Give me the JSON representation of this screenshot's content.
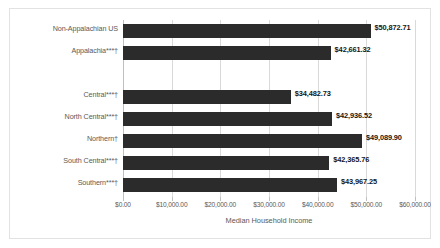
{
  "chart_data": {
    "type": "bar",
    "orientation": "horizontal",
    "title": "",
    "xlabel": "Median Household Income",
    "ylabel": "",
    "xlim": [
      0,
      60000
    ],
    "grid": true,
    "legend": "none",
    "xticks": [
      "$0.00",
      "$10,000.00",
      "$20,000.00",
      "$30,000.00",
      "$40,000.00",
      "$50,000.00",
      "$60,000.00"
    ],
    "xtick_values": [
      0,
      10000,
      20000,
      30000,
      40000,
      50000,
      60000
    ],
    "categories": [
      "Non-Appalachian US",
      "Appalachia***†",
      "",
      "Central***†",
      "North Central***†",
      "Northern†",
      "South Central***†",
      "Southern***†"
    ],
    "values": [
      50872.71,
      42661.32,
      null,
      34482.73,
      42936.52,
      49089.9,
      42365.76,
      43967.25
    ],
    "data_labels": [
      "$50,872.71",
      "$42,661.32",
      "",
      "$34,482.73",
      "$42,936.52",
      "$49,089.90",
      "$42,365.76",
      "$43,967.25"
    ],
    "bar_color": "#2b2b2b"
  },
  "rows": [
    {
      "label": "Non-Appalachian US",
      "value_label": "$50,872.71",
      "value": 50872.71
    },
    {
      "label": "Appalachia***†",
      "value_label": "$42,661.32",
      "value": 42661.32
    },
    {
      "label": "Central***†",
      "value_label": "$34,482.73",
      "value": 34482.73
    },
    {
      "label": "North Central***†",
      "value_label": "$42,936.52",
      "value": 42936.52
    },
    {
      "label": "Northern†",
      "value_label": "$49,089.90",
      "value": 49089.9
    },
    {
      "label": "South Central***†",
      "value_label": "$42,365.76",
      "value": 42365.76
    },
    {
      "label": "Southern***†",
      "value_label": "$43,967.25",
      "value": 43967.25
    }
  ],
  "axis": {
    "title": "Median Household Income",
    "ticks": [
      "$0.00",
      "$10,000.00",
      "$20,000.00",
      "$30,000.00",
      "$40,000.00",
      "$50,000.00",
      "$60,000.00"
    ]
  }
}
